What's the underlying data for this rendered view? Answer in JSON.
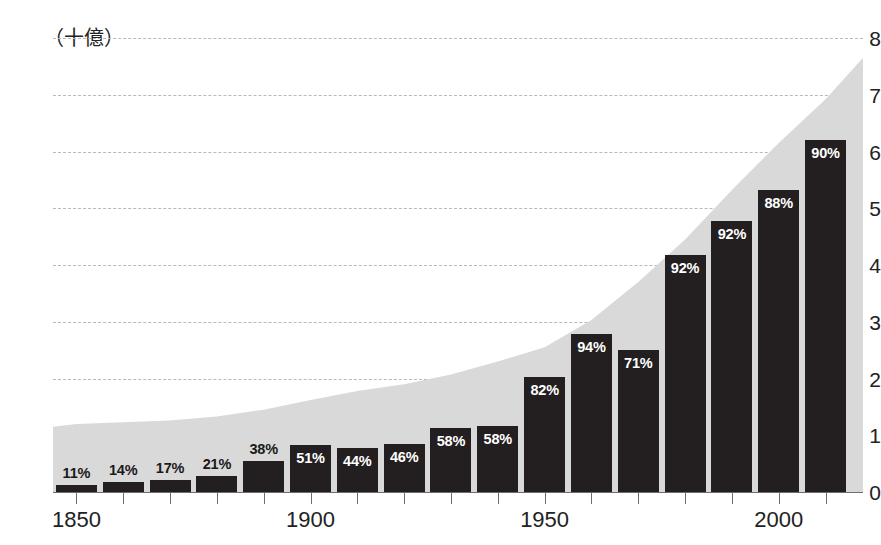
{
  "chart_data": {
    "type": "bar",
    "title": "",
    "subtitle": "",
    "xlabel": "",
    "ylabel": "",
    "y_unit_label": "（十億）",
    "ylim": [
      0,
      8
    ],
    "xlim": [
      1845,
      2018
    ],
    "grid": true,
    "legend": null,
    "y_ticks": [
      0,
      1,
      2,
      3,
      4,
      5,
      6,
      7,
      8
    ],
    "y_tick_labels": [
      "0",
      "1",
      "2",
      "3",
      "4",
      "5",
      "6",
      "7",
      "8"
    ],
    "x_ticks": [
      1850,
      1860,
      1870,
      1880,
      1890,
      1900,
      1910,
      1920,
      1930,
      1940,
      1950,
      1960,
      1970,
      1980,
      1990,
      2000,
      2010
    ],
    "x_tick_labels": [
      "1850",
      "",
      "",
      "",
      "",
      "1900",
      "",
      "",
      "",
      "",
      "1950",
      "",
      "",
      "",
      "",
      "2000",
      ""
    ],
    "x_tick_labels_shown": [
      "1850",
      "1900",
      "1950",
      "2000"
    ],
    "categories": [
      1850,
      1860,
      1870,
      1880,
      1890,
      1900,
      1910,
      1920,
      1930,
      1940,
      1950,
      1960,
      1970,
      1980,
      1990,
      2000,
      2010
    ],
    "bar_value_labels": [
      "11%",
      "14%",
      "17%",
      "21%",
      "38%",
      "51%",
      "44%",
      "46%",
      "58%",
      "58%",
      "82%",
      "94%",
      "71%",
      "92%",
      "92%",
      "88%",
      "90%"
    ],
    "bar_label_positions": [
      "outside",
      "outside",
      "outside",
      "outside",
      "outside",
      "inside",
      "inside",
      "inside",
      "inside",
      "inside",
      "inside",
      "inside",
      "inside",
      "inside",
      "inside",
      "inside",
      "inside"
    ],
    "series": [
      {
        "name": "bars",
        "colorHex": "#231f20",
        "values": [
          0.13,
          0.17,
          0.21,
          0.29,
          0.55,
          0.82,
          0.77,
          0.85,
          1.12,
          1.17,
          2.03,
          2.78,
          2.5,
          4.18,
          4.78,
          5.33,
          6.2
        ]
      },
      {
        "name": "area",
        "colorHex": "#d9d9d9",
        "x": [
          1845,
          1850,
          1860,
          1870,
          1880,
          1890,
          1900,
          1910,
          1920,
          1930,
          1940,
          1950,
          1960,
          1970,
          1980,
          1990,
          2000,
          2010,
          2018
        ],
        "values": [
          1.15,
          1.2,
          1.23,
          1.26,
          1.33,
          1.45,
          1.62,
          1.78,
          1.9,
          2.07,
          2.3,
          2.55,
          3.03,
          3.7,
          4.45,
          5.32,
          6.15,
          6.92,
          7.65
        ]
      }
    ],
    "colors": {
      "bar": "#231f20",
      "area": "#d9d9d9",
      "gridline": "#b9b9b9",
      "axis": "#6d6d6d",
      "text": "#222222",
      "label_inside": "#ffffff",
      "label_outside": "#1a1a1a",
      "background": "#ffffff"
    }
  }
}
